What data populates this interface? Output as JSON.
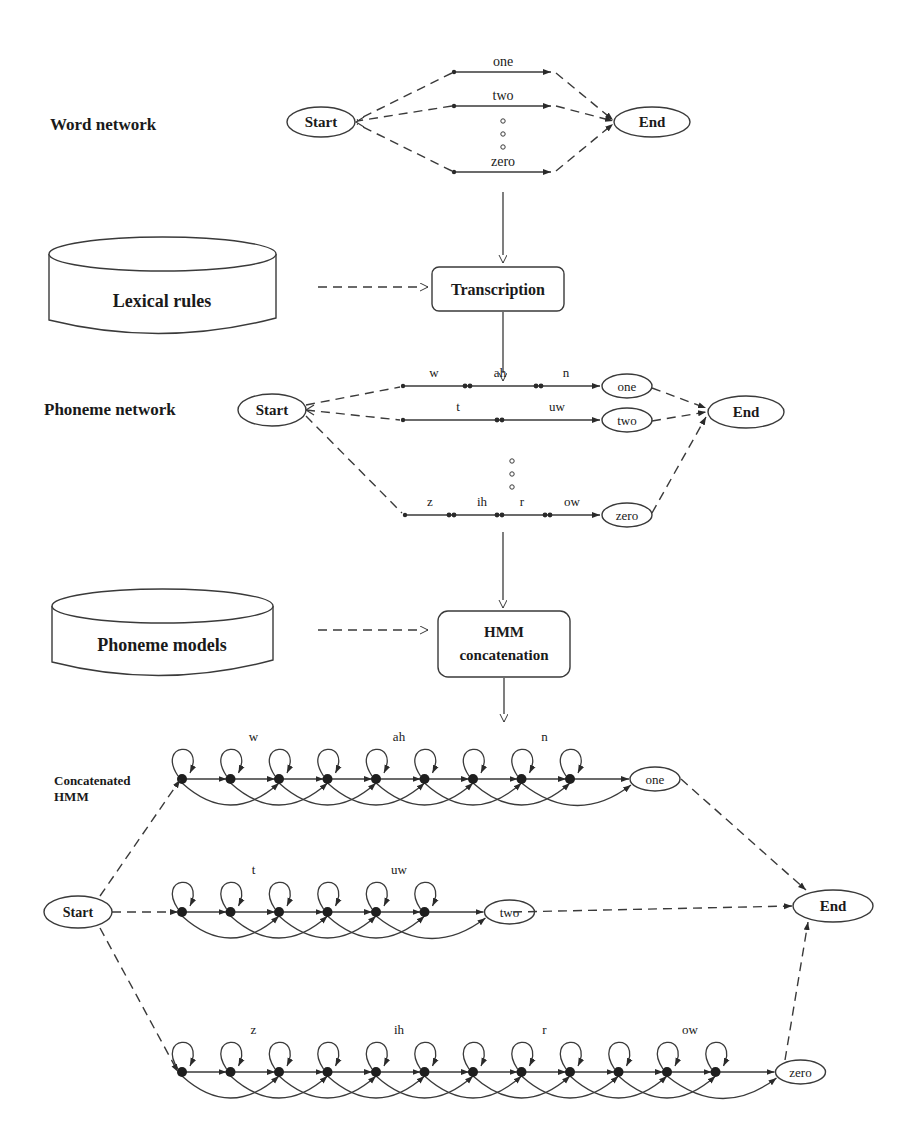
{
  "labels": {
    "word_network": "Word network",
    "phoneme_network": "Phoneme network",
    "concatenated_hmm_line1": "Concatenated",
    "concatenated_hmm_line2": "HMM"
  },
  "databases": {
    "lexical_rules": "Lexical rules",
    "phoneme_models": "Phoneme models"
  },
  "processes": {
    "transcription": "Transcription",
    "hmm_concat_line1": "HMM",
    "hmm_concat_line2": "concatenation"
  },
  "nodes": {
    "start": "Start",
    "end": "End"
  },
  "word_network": {
    "words": [
      "one",
      "two",
      "zero"
    ]
  },
  "phoneme_network": {
    "rows": [
      {
        "word": "one",
        "phonemes": [
          "w",
          "ah",
          "n"
        ]
      },
      {
        "word": "two",
        "phonemes": [
          "t",
          "uw"
        ]
      },
      {
        "word": "zero",
        "phonemes": [
          "z",
          "ih",
          "r",
          "ow"
        ]
      }
    ]
  },
  "hmm": {
    "rows": [
      {
        "word": "one",
        "phonemes": [
          "w",
          "ah",
          "n"
        ]
      },
      {
        "word": "two",
        "phonemes": [
          "t",
          "uw"
        ]
      },
      {
        "word": "zero",
        "phonemes": [
          "z",
          "ih",
          "r",
          "ow"
        ]
      }
    ]
  }
}
